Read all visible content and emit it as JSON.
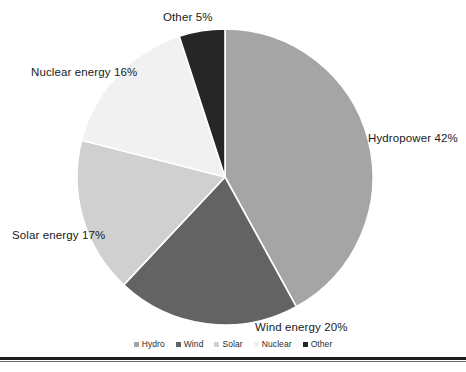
{
  "chart_data": {
    "type": "pie",
    "title": "",
    "categories": [
      "Hydro",
      "Wind",
      "Solar",
      "Nuclear",
      "Other"
    ],
    "values": [
      42,
      20,
      17,
      16,
      5
    ],
    "unit": "%",
    "start_angle_deg": 0,
    "direction": "clockwise",
    "legend_position": "bottom",
    "grid": false,
    "slices": [
      {
        "name": "Hydro",
        "legend_label": "Hydro",
        "data_label": "Hydropower 42%",
        "value": 42,
        "color": "#a5a5a5"
      },
      {
        "name": "Wind",
        "legend_label": "Wind",
        "data_label": "Wind energy 20%",
        "value": 20,
        "color": "#636363"
      },
      {
        "name": "Solar",
        "legend_label": "Solar",
        "data_label": "Solar energy 17%",
        "value": 17,
        "color": "#d0d0d0"
      },
      {
        "name": "Nuclear",
        "legend_label": "Nuclear",
        "data_label": "Nuclear energy 16%",
        "value": 16,
        "color": "#f1f1f1"
      },
      {
        "name": "Other",
        "legend_label": "Other",
        "data_label": "Other 5%",
        "value": 5,
        "color": "#262626"
      }
    ]
  },
  "labels": {
    "hydro": "Hydropower 42%",
    "wind": "Wind energy 20%",
    "solar": "Solar energy 17%",
    "nuclear": "Nuclear energy 16%",
    "other": "Other 5%"
  },
  "legend": {
    "items": [
      {
        "label": "Hydro",
        "color": "#a5a5a5"
      },
      {
        "label": "Wind",
        "color": "#636363"
      },
      {
        "label": "Solar",
        "color": "#d0d0d0"
      },
      {
        "label": "Nuclear",
        "color": "#f1f1f1"
      },
      {
        "label": "Other",
        "color": "#262626"
      }
    ]
  },
  "style": {
    "background": "#ffffff",
    "slice_border": "#ffffff",
    "rule_color": "#1c1c1c",
    "label_color": "#1a1a1a"
  }
}
